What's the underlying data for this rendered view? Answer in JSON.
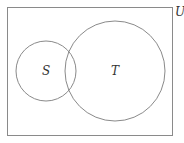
{
  "diagram": {
    "type": "venn",
    "universe": {
      "label": "U",
      "x": 7,
      "y": 7,
      "width": 165,
      "height": 128
    },
    "sets": [
      {
        "label": "S",
        "cx": 46,
        "cy": 71,
        "r": 30
      },
      {
        "label": "T",
        "cx": 115,
        "cy": 71,
        "r": 50
      }
    ],
    "colors": {
      "stroke": "#8a8a8a",
      "text": "#333333",
      "background": "#ffffff"
    }
  }
}
